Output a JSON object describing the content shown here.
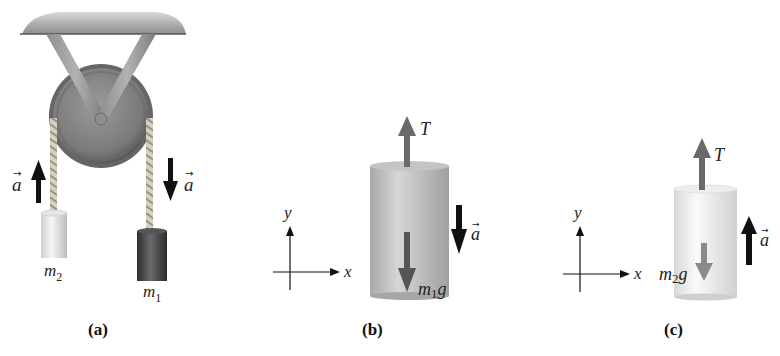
{
  "panels": {
    "a": {
      "caption": "(a)",
      "mass_left_label": "m",
      "mass_left_sub": "2",
      "mass_right_label": "m",
      "mass_right_sub": "1",
      "accel_left_label": "a",
      "accel_right_label": "a",
      "accel_left_direction": "up",
      "accel_right_direction": "down"
    },
    "b": {
      "caption": "(b)",
      "tension_label": "T",
      "weight_label": "m",
      "weight_sub": "1",
      "weight_suffix": "g",
      "accel_label": "a",
      "accel_direction": "down",
      "axis_x": "x",
      "axis_y": "y"
    },
    "c": {
      "caption": "(c)",
      "tension_label": "T",
      "weight_label": "m",
      "weight_sub": "2",
      "weight_suffix": "g",
      "accel_label": "a",
      "accel_direction": "up",
      "axis_x": "x",
      "axis_y": "y"
    }
  },
  "colors": {
    "ceiling": "#8a8a8a",
    "pulley": "#7d7d7d",
    "pulley_dark": "#5e5e5e",
    "rope": "#c8c2b4",
    "mass_light": "#e6e6e6",
    "mass_dark": "#3f3f3f",
    "cylinder_b": "#b8b8b8",
    "cylinder_c": "#ececec",
    "force_arrow": "#6a6a6a",
    "accel_arrow": "#111111"
  }
}
